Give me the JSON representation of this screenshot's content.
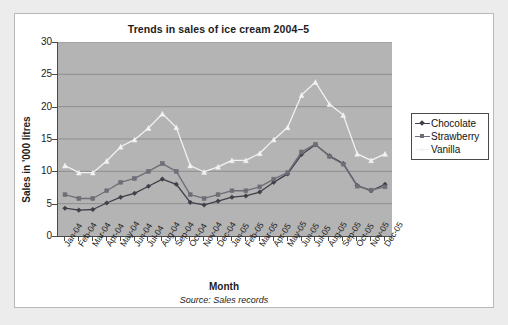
{
  "chart_data": {
    "type": "line",
    "title": "Trends in sales of ice cream 2004–5",
    "xlabel": "Month",
    "ylabel": "Sales in '000 litres",
    "source_note": "Source: Sales records",
    "grid": true,
    "legend_position": "right",
    "ylim": [
      0,
      30
    ],
    "yticks": [
      0,
      5,
      10,
      15,
      20,
      25,
      30
    ],
    "ytick_labels": [
      "0",
      "5",
      "10",
      "15",
      "20",
      "25",
      "30"
    ],
    "categories": [
      "Jan-04",
      "Feb-04",
      "Mar-04",
      "Apr-04",
      "May-04",
      "Jun-04",
      "Jul-04",
      "Aug-04",
      "Sep-04",
      "Oct-04",
      "Nov-04",
      "Dec-04",
      "Jan-05",
      "Feb-05",
      "Mar-05",
      "Apr-05",
      "May-05",
      "Jun-05",
      "Jul-05",
      "Aug-05",
      "Sep-05",
      "Oct-05",
      "Nov-05",
      "Dec-05"
    ],
    "series": [
      {
        "name": "Chocolate",
        "color": "#3f3f4a",
        "marker": "diamond",
        "values": [
          4.3,
          4.0,
          4.1,
          5.1,
          6.0,
          6.6,
          7.7,
          8.8,
          8.0,
          5.2,
          4.8,
          5.4,
          6.0,
          6.2,
          6.8,
          8.3,
          9.6,
          12.6,
          14.1,
          12.4,
          11.2,
          7.8,
          7.0,
          8.0
        ]
      },
      {
        "name": "Strawberry",
        "color": "#6e6e78",
        "marker": "square",
        "values": [
          6.4,
          5.8,
          5.8,
          7.0,
          8.3,
          8.9,
          10.0,
          11.2,
          10.0,
          6.4,
          5.8,
          6.4,
          7.0,
          7.0,
          7.6,
          8.8,
          9.8,
          13.0,
          14.2,
          12.3,
          11.1,
          7.7,
          7.1,
          7.6
        ]
      },
      {
        "name": "Vanilla",
        "color": "#f2f2f2",
        "marker": "triangle",
        "values": [
          10.9,
          9.8,
          9.8,
          11.6,
          13.8,
          14.9,
          16.7,
          18.9,
          16.8,
          10.9,
          9.9,
          10.7,
          11.7,
          11.7,
          12.8,
          14.9,
          16.8,
          21.8,
          23.8,
          20.4,
          18.7,
          12.7,
          11.7,
          12.7
        ]
      }
    ]
  },
  "colors": {
    "page_background": "#ececed",
    "card_background": "#ffffff",
    "plot_background": "#b4b4b4",
    "axis": "#4a4a4a",
    "gridline": "#8f8f8f",
    "text": "#1d1d1d"
  }
}
